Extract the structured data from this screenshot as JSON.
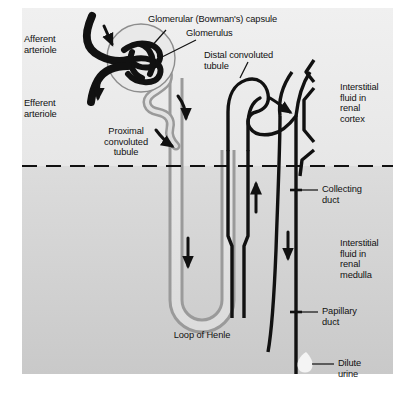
{
  "figure": {
    "type": "anatomical-diagram",
    "canvas": {
      "width": 415,
      "height": 401
    },
    "colors": {
      "page_background": "#ffffff",
      "cortex_background": "#eeeeee",
      "medulla_background": "#d2d2d2",
      "tubule_stroke_dark": "#111111",
      "tubule_stroke_light": "#8d8d8d",
      "tubule_lumen": "#e3e3e3",
      "capsule_fill": "#e9e9e9",
      "text": "#111111",
      "urine_drop": "#f4f4f4"
    },
    "regions": [
      {
        "name": "renal cortex",
        "note": "upper lighter zone above dashed boundary"
      },
      {
        "name": "renal medulla",
        "note": "lower darker zone below dashed boundary"
      }
    ],
    "boundary": {
      "style": "dashed",
      "name": "corticomedullary junction"
    }
  },
  "labels": {
    "afferent_arteriole": "Afferent\narteriole",
    "efferent_arteriole": "Efferent\narteriole",
    "bowmans_capsule": "Glomerular (Bowman's) capsule",
    "glomerulus": "Glomerulus",
    "proximal_convoluted_tubule": "Proximal\nconvoluted\ntubule",
    "distal_convoluted_tubule": "Distal convoluted\ntubule",
    "interstitial_fluid_cortex": "Interstitial\nfluid in\nrenal\ncortex",
    "collecting_duct": "Collecting\nduct",
    "interstitial_fluid_medulla": "Interstitial\nfluid in\nrenal\nmedulla",
    "papillary_duct": "Papillary\nduct",
    "dilute_urine": "Dilute\nurine",
    "loop_of_henle": "Loop of Henle"
  },
  "flow_arrows": [
    {
      "name": "afferent-inflow-arrow",
      "direction": "down-right"
    },
    {
      "name": "efferent-outflow-arrow",
      "direction": "down"
    },
    {
      "name": "proximal-flow-arrow-upper",
      "direction": "down-right"
    },
    {
      "name": "proximal-flow-arrow-lower",
      "direction": "down-right"
    },
    {
      "name": "descending-limb-arrow",
      "direction": "down"
    },
    {
      "name": "ascending-limb-arrow",
      "direction": "up"
    },
    {
      "name": "distal-to-collecting-arrow",
      "direction": "right-down"
    },
    {
      "name": "collecting-duct-arrow",
      "direction": "down"
    }
  ]
}
